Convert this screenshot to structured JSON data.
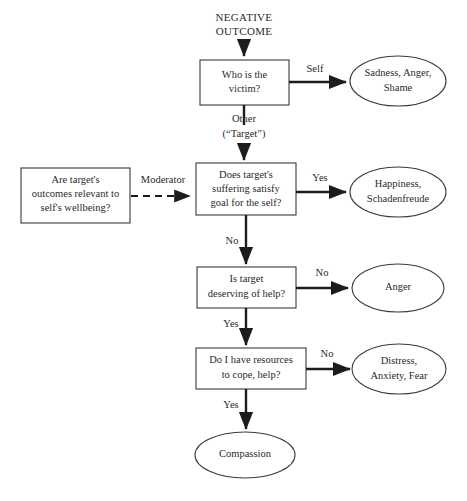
{
  "diagram": {
    "start_label": {
      "line1": "NEGATIVE",
      "line2": "OUTCOME"
    },
    "nodes": [
      {
        "id": "who-is-the-victim",
        "shape": "box",
        "lines": [
          "Who is the",
          "victim?"
        ]
      },
      {
        "id": "are-targets-outcomes-relevant",
        "shape": "box",
        "lines": [
          "Are target's",
          "outcomes relevant to",
          "self's wellbeing?"
        ]
      },
      {
        "id": "does-target-suffering-satisfy-goal",
        "shape": "box",
        "lines": [
          "Does target's",
          "suffering satisfy",
          "goal for the self?"
        ]
      },
      {
        "id": "is-target-deserving-of-help",
        "shape": "box",
        "lines": [
          "Is target",
          "deserving of help?"
        ]
      },
      {
        "id": "do-i-have-resources",
        "shape": "box",
        "lines": [
          "Do I have resources",
          "to cope, help?"
        ]
      },
      {
        "id": "sadness-anger-shame",
        "shape": "ellipse",
        "lines": [
          "Sadness, Anger,",
          "Shame"
        ]
      },
      {
        "id": "happiness-schadenfreude",
        "shape": "ellipse",
        "lines": [
          "Happiness,",
          "Schadenfreude"
        ]
      },
      {
        "id": "anger",
        "shape": "ellipse",
        "lines": [
          "Anger"
        ]
      },
      {
        "id": "distress-anxiety-fear",
        "shape": "ellipse",
        "lines": [
          "Distress,",
          "Anxiety, Fear"
        ]
      },
      {
        "id": "compassion",
        "shape": "ellipse",
        "lines": [
          "Compassion"
        ]
      }
    ],
    "edges": [
      {
        "id": "victim-to-self",
        "label": "Self",
        "from": "who-is-the-victim",
        "to": "sadness-anger-shame",
        "style": "solid"
      },
      {
        "id": "victim-to-other",
        "label_line1": "Other",
        "label_line2": "(“Target”)",
        "from": "who-is-the-victim",
        "to": "does-target-suffering-satisfy-goal",
        "style": "solid"
      },
      {
        "id": "moderator",
        "label": "Moderator",
        "from": "are-targets-outcomes-relevant",
        "to": "does-target-suffering-satisfy-goal",
        "style": "dashed"
      },
      {
        "id": "suffering-yes",
        "label": "Yes",
        "from": "does-target-suffering-satisfy-goal",
        "to": "happiness-schadenfreude",
        "style": "solid"
      },
      {
        "id": "suffering-no",
        "label": "No",
        "from": "does-target-suffering-satisfy-goal",
        "to": "is-target-deserving-of-help",
        "style": "solid"
      },
      {
        "id": "deserving-no",
        "label": "No",
        "from": "is-target-deserving-of-help",
        "to": "anger",
        "style": "solid"
      },
      {
        "id": "deserving-yes",
        "label": "Yes",
        "from": "is-target-deserving-of-help",
        "to": "do-i-have-resources",
        "style": "solid"
      },
      {
        "id": "resources-no",
        "label": "No",
        "from": "do-i-have-resources",
        "to": "distress-anxiety-fear",
        "style": "solid"
      },
      {
        "id": "resources-yes",
        "label": "Yes",
        "from": "do-i-have-resources",
        "to": "compassion",
        "style": "solid"
      }
    ],
    "colors": {
      "background": "#ffffff",
      "node_stroke": "#3a3a3a",
      "line": "#1c1c1c",
      "text": "#2a2a2a"
    }
  }
}
